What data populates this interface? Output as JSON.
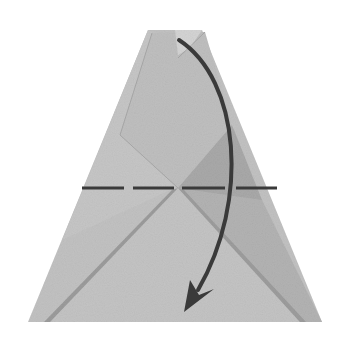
{
  "diagram": {
    "type": "origami-step",
    "colors": {
      "background": "#ffffff",
      "paper_light": "#c9c9c9",
      "paper_mid": "#b7b7b7",
      "paper_dark": "#a4a4a4",
      "shadow": "#8f8f8f",
      "fold_line": "#3a3a3a",
      "arrow": "#3a3a3a"
    },
    "elements": {
      "paper": "trapezoid-shaped folded paper",
      "fold_line": "dashed horizontal valley-fold line",
      "arrow": "curved arrow from top point down to bottom"
    }
  }
}
